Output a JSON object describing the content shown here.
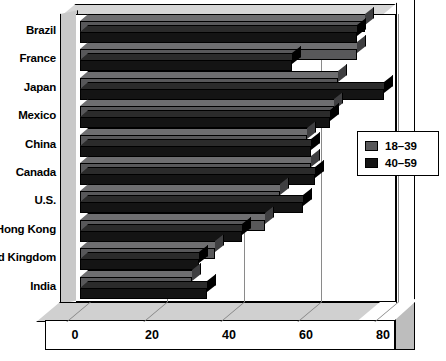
{
  "chart_data": {
    "type": "bar",
    "orientation": "horizontal",
    "title": "",
    "xlabel": "",
    "ylabel": "",
    "xlim": [
      0,
      90
    ],
    "xticks": [
      0,
      20,
      40,
      60,
      80
    ],
    "xtick_labels": [
      "0",
      "20",
      "40",
      "60",
      "80"
    ],
    "grid": true,
    "legend_position": "right",
    "categories": [
      "Brazil",
      "France",
      "Japan",
      "Mexico",
      "China",
      "Canada",
      "U.S.",
      "Hong Kong",
      "United Kingdom",
      "India"
    ],
    "series": [
      {
        "name": "18–39",
        "color": "#58585a",
        "values": [
          74,
          72,
          67,
          66,
          59,
          60,
          52,
          48,
          35,
          29
        ]
      },
      {
        "name": "40–59",
        "color": "#141414",
        "values": [
          72,
          55,
          79,
          65,
          60,
          61,
          58,
          42,
          31,
          33
        ]
      }
    ]
  },
  "legend": {
    "entries": [
      {
        "label": "18–39",
        "swatch": "legend-swatch-gray"
      },
      {
        "label": "40–59",
        "swatch": "legend-swatch-black"
      }
    ]
  }
}
